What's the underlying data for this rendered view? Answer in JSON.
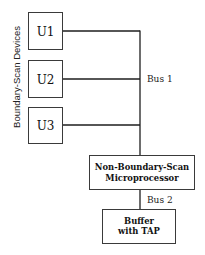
{
  "side_label": "Boundary-Scan Devices",
  "devices": [
    {
      "label": "U1"
    },
    {
      "label": "U2"
    },
    {
      "label": "U3"
    }
  ],
  "bus1_label": "Bus 1",
  "bus2_label": "Bus 2",
  "microprocessor": {
    "line1": "Non-Boundary-Scan",
    "line2": "Microprocessor"
  },
  "buffer": {
    "line1": "Buffer",
    "line2": "with TAP"
  }
}
